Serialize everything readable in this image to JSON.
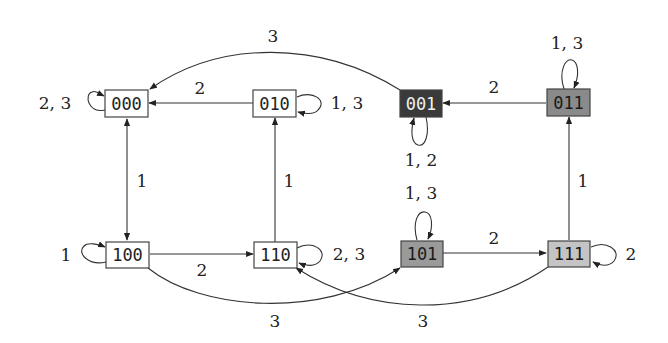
{
  "diagram": {
    "type": "state-transition-graph",
    "nodes": [
      {
        "id": "000",
        "label": "000",
        "fill": "#ffffff",
        "text_color": "#222222"
      },
      {
        "id": "010",
        "label": "010",
        "fill": "#ffffff",
        "text_color": "#222222"
      },
      {
        "id": "001",
        "label": "001",
        "fill": "#3a3a3a",
        "text_color": "#f0f0f0"
      },
      {
        "id": "011",
        "label": "011",
        "fill": "#8a8a8a",
        "text_color": "#1a1a1a"
      },
      {
        "id": "100",
        "label": "100",
        "fill": "#ffffff",
        "text_color": "#222222"
      },
      {
        "id": "110",
        "label": "110",
        "fill": "#ffffff",
        "text_color": "#222222"
      },
      {
        "id": "101",
        "label": "101",
        "fill": "#9a9a9a",
        "text_color": "#1a1a1a"
      },
      {
        "id": "111",
        "label": "111",
        "fill": "#c4c4c4",
        "text_color": "#1a1a1a"
      }
    ],
    "edges": [
      {
        "from": "000",
        "to": "000",
        "label": "2, 3",
        "kind": "loop-left"
      },
      {
        "from": "010",
        "to": "000",
        "label": "2",
        "kind": "straight"
      },
      {
        "from": "010",
        "to": "010",
        "label": "1, 3",
        "kind": "loop-right"
      },
      {
        "from": "001",
        "to": "000",
        "label": "3",
        "kind": "curve-top"
      },
      {
        "from": "001",
        "to": "001",
        "label": "1, 2",
        "kind": "loop-bottom"
      },
      {
        "from": "011",
        "to": "001",
        "label": "2",
        "kind": "straight"
      },
      {
        "from": "011",
        "to": "011",
        "label": "1, 3",
        "kind": "loop-top"
      },
      {
        "from": "000",
        "to": "100",
        "label": "1",
        "kind": "bidirectional"
      },
      {
        "from": "110",
        "to": "010",
        "label": "1",
        "kind": "straight"
      },
      {
        "from": "111",
        "to": "011",
        "label": "1",
        "kind": "straight"
      },
      {
        "from": "100",
        "to": "100",
        "label": "1",
        "kind": "loop-left"
      },
      {
        "from": "100",
        "to": "110",
        "label": "2",
        "kind": "straight"
      },
      {
        "from": "110",
        "to": "110",
        "label": "2, 3",
        "kind": "loop-right"
      },
      {
        "from": "100",
        "to": "101",
        "label": "3",
        "kind": "curve-bottom"
      },
      {
        "from": "101",
        "to": "101",
        "label": "1, 3",
        "kind": "loop-top"
      },
      {
        "from": "101",
        "to": "111",
        "label": "2",
        "kind": "straight"
      },
      {
        "from": "111",
        "to": "111",
        "label": "2",
        "kind": "loop-right"
      },
      {
        "from": "111",
        "to": "110",
        "label": "3",
        "kind": "curve-bottom"
      }
    ]
  }
}
